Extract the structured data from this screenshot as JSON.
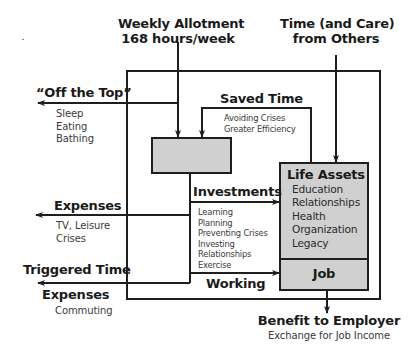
{
  "colors": {
    "line": "#1e1e1e",
    "box_fill": "#d0d0d0",
    "text": "#1a1a1a",
    "subtext": "#3a3a3a"
  },
  "inputs": {
    "weekly_allotment": {
      "title": "Weekly Allotment",
      "subtitle": "168 hours/week"
    },
    "time_from_others": {
      "line1": "Time (and Care)",
      "line2": "from Others"
    }
  },
  "outflows": {
    "off_the_top": {
      "title": "“Off the Top”",
      "items": [
        "Sleep",
        "Eating",
        "Bathing"
      ]
    },
    "expenses": {
      "title": "Expenses",
      "items": [
        "TV, Leisure",
        "Crises"
      ]
    },
    "triggered": {
      "title_line1": "Triggered Time",
      "title_line2": "Expenses",
      "items": [
        "Commuting"
      ]
    }
  },
  "saved_time": {
    "title": "Saved Time",
    "items": [
      "Avoiding Crises",
      "Greater Efficiency"
    ]
  },
  "investments": {
    "title": "Investments",
    "items": [
      "Learning",
      "Planning",
      "Preventing Crises",
      "Investing",
      "Relationships",
      "Exercise"
    ]
  },
  "working": {
    "title": "Working"
  },
  "life_assets": {
    "title": "Life Assets",
    "items": [
      "Education",
      "Relationships",
      "Health",
      "Organization",
      "Legacy"
    ]
  },
  "job": {
    "title": "Job"
  },
  "benefit": {
    "title": "Benefit to Employer",
    "subtitle": "Exchange for Job Income"
  }
}
